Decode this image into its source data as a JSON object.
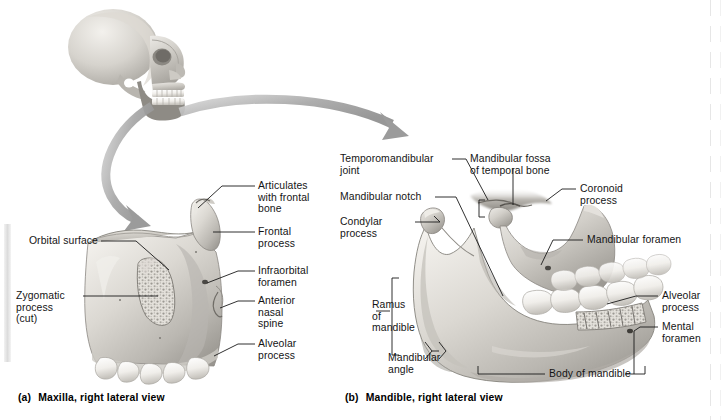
{
  "figure": {
    "background": "#ffffff",
    "leader_color": "#1a1a1a",
    "bone_light": "#f0eeea",
    "bone_mid": "#c9c6c0",
    "bone_dark": "#8f8c86",
    "arrow_color": "#9d9d9d"
  },
  "panels": [
    {
      "id": "a",
      "plate": "(a)",
      "caption": "Maxilla, right lateral view",
      "labels": [
        {
          "key": "articulates_with_frontal_bone",
          "text": "Articulates\nwith frontal\nbone",
          "align": "left"
        },
        {
          "key": "frontal_process",
          "text": "Frontal\nprocess",
          "align": "left"
        },
        {
          "key": "infraorbital_foramen",
          "text": "Infraorbital\nforamen",
          "align": "left"
        },
        {
          "key": "anterior_nasal_spine",
          "text": "Anterior\nnasal\nspine",
          "align": "left"
        },
        {
          "key": "alveolar_process",
          "text": "Alveolar\nprocess",
          "align": "left"
        },
        {
          "key": "orbital_surface",
          "text": "Orbital surface",
          "align": "right"
        },
        {
          "key": "zygomatic_process_cut",
          "text": "Zygomatic\nprocess\n(cut)",
          "align": "left"
        }
      ]
    },
    {
      "id": "b",
      "plate": "(b)",
      "caption": "Mandible, right lateral view",
      "labels": [
        {
          "key": "temporomandibular_joint",
          "text": "Temporomandibular\njoint",
          "align": "left"
        },
        {
          "key": "mandibular_notch",
          "text": "Mandibular notch",
          "align": "left"
        },
        {
          "key": "condylar_process",
          "text": "Condylar\nprocess",
          "align": "left"
        },
        {
          "key": "mandibular_fossa_of_temporal_bone",
          "text": "Mandibular fossa\nof temporal bone",
          "align": "left"
        },
        {
          "key": "coronoid_process",
          "text": "Coronoid\nprocess",
          "align": "left"
        },
        {
          "key": "mandibular_foramen",
          "text": "Mandibular foramen",
          "align": "left"
        },
        {
          "key": "alveolar_process",
          "text": "Alveolar\nprocess",
          "align": "left"
        },
        {
          "key": "mental_foramen",
          "text": "Mental\nforamen",
          "align": "left"
        },
        {
          "key": "ramus_of_mandible",
          "text": "Ramus\nof\nmandible",
          "align": "left"
        },
        {
          "key": "mandibular_angle",
          "text": "Mandibular\nangle",
          "align": "left"
        },
        {
          "key": "body_of_mandible",
          "text": "Body of mandible",
          "align": "center"
        }
      ]
    }
  ],
  "orientation_skull": {
    "name": "lateral-skull-orientation-figure",
    "description": "Grayscale right lateral skull, facing right"
  },
  "arrows": [
    {
      "key": "arrow_to_maxilla",
      "description": "Curved gray arrow from skull maxilla down to panel a"
    },
    {
      "key": "arrow_to_mandible",
      "description": "Curved gray arrow sweeping right to panel b"
    }
  ]
}
